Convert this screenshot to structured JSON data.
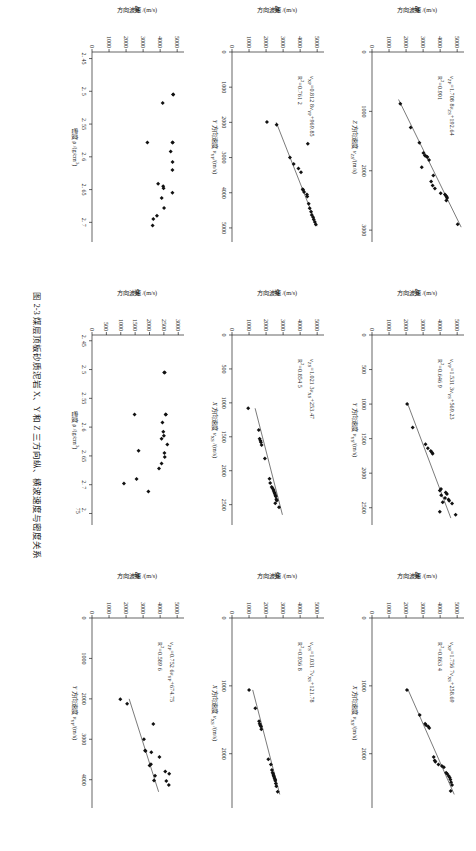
{
  "figure": {
    "caption": "图 2-3  煤层顶板砂质泥岩 X、Y 和 Z 三方向纵、横波速度与密度关系",
    "panel_count": 9,
    "columns": 3,
    "rows": 3
  },
  "chart_data": [
    {
      "id": "panel-a",
      "type": "scatter",
      "title": "",
      "xlabel": "Z 方向速度 v_ZS /(m/s)",
      "ylabel": "Z 方向波速 v_ZP /(m/s)",
      "xlabel_plain": "Z 方向速度 vZS/(m/s)",
      "ylabel_plain": "Z 方向波速 vZP/(m/s)",
      "xticks": [
        0,
        1000,
        2000,
        3000
      ],
      "yticks": [
        0,
        1000,
        2000,
        3000,
        4000,
        5000
      ],
      "xlim": [
        0,
        3200
      ],
      "ylim": [
        0,
        5400
      ],
      "grid": false,
      "legend": "none",
      "annotations": [
        "vZP=1.708 8vZS+192.64",
        "R2=0.901"
      ],
      "equation": "vZP=1.708 8vZS+192.64",
      "r2": "R2=0.901",
      "fit": {
        "slope": 1.7088,
        "intercept": 192.64,
        "x0": 800,
        "x1": 2950
      },
      "points": [
        [
          870,
          1660
        ],
        [
          1270,
          2270
        ],
        [
          1530,
          2780
        ],
        [
          1700,
          3020
        ],
        [
          1745,
          3105
        ],
        [
          1760,
          3200
        ],
        [
          1770,
          3250
        ],
        [
          1820,
          3350
        ],
        [
          1940,
          2920
        ],
        [
          2080,
          3600
        ],
        [
          2180,
          3470
        ],
        [
          2250,
          3560
        ],
        [
          2300,
          3690
        ],
        [
          2380,
          4030
        ],
        [
          2400,
          4280
        ],
        [
          2420,
          4340
        ],
        [
          2440,
          4390
        ],
        [
          2460,
          4410
        ],
        [
          2500,
          4360
        ],
        [
          2900,
          5030
        ]
      ]
    },
    {
      "id": "panel-b",
      "type": "scatter",
      "xlabel_plain": "Y 方向速度 vYS/(m/s)",
      "ylabel_plain": "Y 方向波速 vYP/(m/s)",
      "xticks": [
        0,
        500,
        1000,
        1500,
        2000,
        2500
      ],
      "yticks": [
        0,
        1000,
        2000,
        3000,
        4000,
        5000
      ],
      "xlim": [
        0,
        2750
      ],
      "ylim": [
        0,
        5400
      ],
      "grid": false,
      "legend": "none",
      "annotations": [
        "vYP=1.531 3vYS+569.23",
        "R2=0.646 9"
      ],
      "equation": "vYP=1.531 3vYS+569.23",
      "r2": "R2=0.646 9",
      "fit": {
        "slope": 1.5313,
        "intercept": 569.23,
        "x0": 1000,
        "x1": 2650
      },
      "points": [
        [
          1000,
          2060
        ],
        [
          1340,
          2390
        ],
        [
          1580,
          3140
        ],
        [
          1640,
          3280
        ],
        [
          1680,
          3450
        ],
        [
          1700,
          3520
        ],
        [
          1720,
          3560
        ],
        [
          2230,
          4050
        ],
        [
          2250,
          3980
        ],
        [
          2280,
          4330
        ],
        [
          2300,
          4400
        ],
        [
          2320,
          4060
        ],
        [
          2360,
          4290
        ],
        [
          2380,
          4490
        ],
        [
          2400,
          4530
        ],
        [
          2420,
          4150
        ],
        [
          2440,
          4700
        ],
        [
          2560,
          3980
        ],
        [
          2600,
          4910
        ]
      ]
    },
    {
      "id": "panel-c",
      "type": "scatter",
      "xlabel_plain": "X 方向速度 vXS/(m/s)",
      "ylabel_plain": "X 方向波速 vXP/(m/s)",
      "xticks": [
        0,
        1000,
        2000
      ],
      "yticks": [
        0,
        1000,
        2000,
        3000,
        4000,
        5000
      ],
      "xlim": [
        0,
        2800
      ],
      "ylim": [
        0,
        5400
      ],
      "grid": false,
      "legend": "none",
      "annotations": [
        "vXP=1.756 7vXS+258.69",
        "R2=0.863 4"
      ],
      "equation": "vXP=1.756 7vXS+258.69",
      "r2": "R2=0.863 4",
      "fit": {
        "slope": 1.7567,
        "intercept": 258.69,
        "x0": 1050,
        "x1": 2600
      },
      "points": [
        [
          1060,
          2050
        ],
        [
          1430,
          2800
        ],
        [
          1560,
          3120
        ],
        [
          1580,
          3180
        ],
        [
          1600,
          3300
        ],
        [
          1620,
          3360
        ],
        [
          2050,
          3620
        ],
        [
          2100,
          3680
        ],
        [
          2120,
          3720
        ],
        [
          2160,
          3900
        ],
        [
          2180,
          4100
        ],
        [
          2200,
          4220
        ],
        [
          2280,
          4350
        ],
        [
          2300,
          4420
        ],
        [
          2330,
          4500
        ],
        [
          2350,
          4560
        ],
        [
          2380,
          4600
        ],
        [
          2420,
          4640
        ],
        [
          2460,
          4700
        ],
        [
          2550,
          4620
        ]
      ]
    },
    {
      "id": "panel-d",
      "type": "scatter",
      "xlabel_plain": "Y 方向速度 vYP/(m/s)",
      "ylabel_plain": "X 方向波速 vXP/(m/s)",
      "xticks": [
        0,
        1000,
        2000,
        3000,
        4000,
        5000
      ],
      "yticks": [
        0,
        1000,
        2000,
        3000,
        4000,
        5000
      ],
      "xlim": [
        0,
        5400
      ],
      "ylim": [
        0,
        5400
      ],
      "grid": false,
      "legend": "none",
      "annotations": [
        "vXP=0.812 8vYP+969.85",
        "R2=0.761 2"
      ],
      "equation": "vXP=0.812 8vYP+969.85",
      "r2": "R2=0.761 2",
      "fit": {
        "slope": 0.8128,
        "intercept": 969.85,
        "x0": 2000,
        "x1": 4950
      },
      "points": [
        [
          1990,
          2050
        ],
        [
          2070,
          2620
        ],
        [
          2610,
          4450
        ],
        [
          3000,
          3400
        ],
        [
          3180,
          3620
        ],
        [
          3310,
          3900
        ],
        [
          3420,
          4050
        ],
        [
          3900,
          4150
        ],
        [
          3920,
          4180
        ],
        [
          3980,
          4230
        ],
        [
          4050,
          4400
        ],
        [
          4110,
          4420
        ],
        [
          4310,
          4500
        ],
        [
          4440,
          4560
        ],
        [
          4540,
          4640
        ],
        [
          4630,
          4680
        ],
        [
          4700,
          4760
        ],
        [
          4760,
          4800
        ],
        [
          4830,
          4860
        ],
        [
          4900,
          4920
        ]
      ]
    },
    {
      "id": "panel-e",
      "type": "scatter",
      "xlabel_plain": "X 方向速度 vXS /(m/s)",
      "ylabel_plain": "Z 方向波速 vZS/(m/s)",
      "xticks": [
        0,
        500,
        1000,
        1500,
        2000,
        2500
      ],
      "yticks": [
        0,
        1000,
        2000,
        3000,
        4000,
        5000
      ],
      "xlim": [
        0,
        2800
      ],
      "ylim": [
        0,
        5400
      ],
      "grid": false,
      "legend": "none",
      "annotations": [
        "vZS=1.021 3vXS+253.47",
        "R2=0.854 5"
      ],
      "equation": "vZS=1.021 3vXS+253.47",
      "r2": "R2=0.854 5",
      "fit": {
        "slope": 1.0213,
        "intercept": 253.47,
        "x0": 1080,
        "x1": 2650
      },
      "points": [
        [
          1080,
          950
        ],
        [
          1400,
          1570
        ],
        [
          1530,
          1620
        ],
        [
          1560,
          1670
        ],
        [
          1580,
          1700
        ],
        [
          1620,
          1740
        ],
        [
          1820,
          1930
        ],
        [
          2120,
          2200
        ],
        [
          2180,
          2240
        ],
        [
          2240,
          2330
        ],
        [
          2260,
          2380
        ],
        [
          2280,
          2430
        ],
        [
          2300,
          2450
        ],
        [
          2320,
          2490
        ],
        [
          2340,
          2510
        ],
        [
          2360,
          2550
        ],
        [
          2380,
          2570
        ],
        [
          2420,
          2600
        ],
        [
          2440,
          2630
        ],
        [
          2480,
          2540
        ],
        [
          2540,
          2760
        ]
      ]
    },
    {
      "id": "panel-f",
      "type": "scatter",
      "xlabel_plain": "X 方向速度 vXS /(m/s)",
      "ylabel_plain": "Y 方向波速 vYS/(m/s)",
      "xticks": [
        0,
        1000,
        2000
      ],
      "yticks": [
        0,
        1000,
        2000,
        3000,
        4000,
        5000
      ],
      "xlim": [
        0,
        2800
      ],
      "ylim": [
        0,
        5400
      ],
      "grid": false,
      "legend": "none",
      "annotations": [
        "vYS=1.031 7vXS+121.78",
        "R2=0.936 8"
      ],
      "equation": "vYS=1.031 7vXS+121.78",
      "r2": "R2=0.936 8",
      "fit": {
        "slope": 1.0317,
        "intercept": 121.78,
        "x0": 1060,
        "x1": 2600
      },
      "points": [
        [
          1060,
          1000
        ],
        [
          1330,
          1370
        ],
        [
          1520,
          1590
        ],
        [
          1560,
          1620
        ],
        [
          1580,
          1660
        ],
        [
          1600,
          1700
        ],
        [
          1640,
          1720
        ],
        [
          2080,
          2130
        ],
        [
          2160,
          2280
        ],
        [
          2240,
          2340
        ],
        [
          2280,
          2380
        ],
        [
          2300,
          2420
        ],
        [
          2320,
          2440
        ],
        [
          2340,
          2460
        ],
        [
          2360,
          2500
        ],
        [
          2380,
          2530
        ],
        [
          2400,
          2540
        ],
        [
          2440,
          2570
        ],
        [
          2480,
          2600
        ],
        [
          2560,
          2680
        ]
      ]
    },
    {
      "id": "panel-g",
      "type": "scatter",
      "xlabel_plain": "密度 ρ /(g/cm3)",
      "ylabel_plain": "X 方向波速 vXP/(m/s)",
      "xticks": [
        2.45,
        2.5,
        2.55,
        2.6,
        2.65,
        2.7
      ],
      "yticks": [
        0,
        1000,
        2000,
        3000,
        4000,
        5000
      ],
      "xlim": [
        2.44,
        2.73
      ],
      "ylim": [
        0,
        5400
      ],
      "grid": false,
      "legend": "none",
      "annotations": [],
      "points": [
        [
          2.505,
          4760
        ],
        [
          2.505,
          4770
        ],
        [
          2.518,
          4150
        ],
        [
          2.578,
          4720
        ],
        [
          2.578,
          4740
        ],
        [
          2.578,
          3250
        ],
        [
          2.592,
          4620
        ],
        [
          2.608,
          4730
        ],
        [
          2.62,
          4720
        ],
        [
          2.641,
          3880
        ],
        [
          2.645,
          4180
        ],
        [
          2.648,
          4200
        ],
        [
          2.655,
          4720
        ],
        [
          2.663,
          4090
        ],
        [
          2.678,
          4230
        ],
        [
          2.69,
          3810
        ],
        [
          2.695,
          3600
        ],
        [
          2.705,
          3560
        ]
      ]
    },
    {
      "id": "panel-h",
      "type": "scatter",
      "xlabel_plain": "密度 ρ /(g/cm3)",
      "ylabel_plain": "X 方向波速 vXS/(m/s)",
      "xticks": [
        2.45,
        2.5,
        2.55,
        2.6,
        2.65,
        2.7,
        2.75
      ],
      "yticks": [
        0,
        500,
        1000,
        1500,
        2000,
        2500,
        3000
      ],
      "xlim": [
        2.44,
        2.77
      ],
      "ylim": [
        0,
        3200
      ],
      "grid": false,
      "legend": "none",
      "annotations": [],
      "points": [
        [
          2.505,
          2510
        ],
        [
          2.505,
          2530
        ],
        [
          2.578,
          2560
        ],
        [
          2.578,
          2570
        ],
        [
          2.578,
          1480
        ],
        [
          2.592,
          2450
        ],
        [
          2.608,
          2480
        ],
        [
          2.615,
          2500
        ],
        [
          2.62,
          2420
        ],
        [
          2.63,
          2620
        ],
        [
          2.641,
          1620
        ],
        [
          2.645,
          2520
        ],
        [
          2.652,
          2530
        ],
        [
          2.663,
          2420
        ],
        [
          2.672,
          2330
        ],
        [
          2.69,
          1550
        ],
        [
          2.698,
          1110
        ],
        [
          2.712,
          1960
        ]
      ]
    },
    {
      "id": "panel-i",
      "type": "scatter",
      "xlabel_plain": "Y 方向速度 vYP/(m/s)",
      "ylabel_plain": "Z 方向波速 vZP/(m/s)",
      "xticks": [
        0,
        1000,
        2000,
        3000,
        4000
      ],
      "yticks": [
        0,
        1000,
        2000,
        3000,
        4000,
        5000
      ],
      "xlim": [
        0,
        4700
      ],
      "ylim": [
        0,
        5400
      ],
      "grid": false,
      "legend": "none",
      "annotations": [
        "vZP=0.752 6vYP+674.75",
        "R2=0.589 6"
      ],
      "equation": "vZP=0.752 6vYP+674.75",
      "r2": "R2=0.589 6",
      "fit": {
        "slope": 0.7526,
        "intercept": 674.75,
        "x0": 2000,
        "x1": 4300
      },
      "points": [
        [
          2010,
          1660
        ],
        [
          2120,
          2060
        ],
        [
          2620,
          3600
        ],
        [
          3000,
          3050
        ],
        [
          3280,
          3120
        ],
        [
          3290,
          3140
        ],
        [
          3320,
          3480
        ],
        [
          3440,
          3960
        ],
        [
          3620,
          3460
        ],
        [
          3650,
          3380
        ],
        [
          3800,
          4300
        ],
        [
          3850,
          4530
        ],
        [
          3900,
          3700
        ],
        [
          4020,
          3640
        ],
        [
          4030,
          4360
        ],
        [
          4130,
          4510
        ]
      ]
    }
  ]
}
